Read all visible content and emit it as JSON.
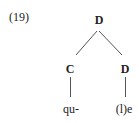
{
  "example": {
    "number": "(19)"
  },
  "tree": {
    "root": {
      "label": "D"
    },
    "children": [
      {
        "label": "C",
        "leaf": "qu-"
      },
      {
        "label": "D",
        "leaf": "(l)e"
      }
    ]
  }
}
